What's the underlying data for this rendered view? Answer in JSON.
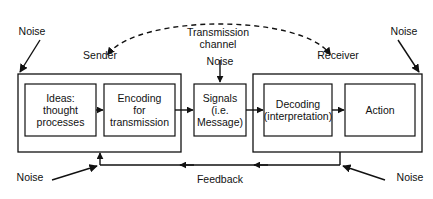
{
  "diagram": {
    "colors": {
      "stroke": "#111111",
      "background": "#ffffff",
      "text": "#111111"
    },
    "groups": {
      "sender": {
        "label": "Sender",
        "x": 18,
        "y": 74,
        "w": 163,
        "h": 78
      },
      "receiver": {
        "label": "Receiver",
        "x": 253,
        "y": 74,
        "w": 169,
        "h": 78
      }
    },
    "boxes": [
      {
        "id": "ideas",
        "text": "Ideas:\nthought\nprocesses",
        "x": 25,
        "y": 84,
        "w": 71,
        "h": 52
      },
      {
        "id": "encoding",
        "text": "Encoding\nfor\ntransmission",
        "x": 104,
        "y": 84,
        "w": 71,
        "h": 52
      },
      {
        "id": "signals",
        "text": "Signals\n(i.e.\nMessage)",
        "x": 194,
        "y": 84,
        "w": 52,
        "h": 52
      },
      {
        "id": "decoding",
        "text": "Decoding\n(interpretation)",
        "x": 264,
        "y": 84,
        "w": 68,
        "h": 52
      },
      {
        "id": "action",
        "text": "Action",
        "x": 345,
        "y": 84,
        "w": 70,
        "h": 52
      }
    ],
    "channel": {
      "label": "Transmission\nchannel",
      "arc_description": "dashed double-headed arc from Sender to Receiver"
    },
    "noise_labels": [
      {
        "id": "noise-top-left",
        "text": "Noise",
        "x": 12,
        "y": 26
      },
      {
        "id": "noise-top-center",
        "text": "Noise",
        "x": 200,
        "y": 56
      },
      {
        "id": "noise-top-right",
        "text": "Noise",
        "x": 384,
        "y": 26
      },
      {
        "id": "noise-bottom-left",
        "text": "Noise",
        "x": 10,
        "y": 172
      },
      {
        "id": "noise-bottom-right",
        "text": "Noise",
        "x": 390,
        "y": 172
      }
    ],
    "feedback": {
      "label": "Feedback"
    }
  }
}
